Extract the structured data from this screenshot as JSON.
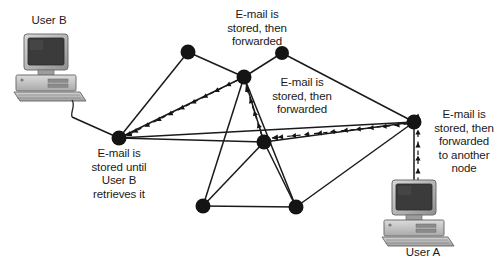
{
  "diagram": {
    "colors": {
      "node_fill": "#141414",
      "line": "#1a1a1a",
      "text": "#1a1a1a",
      "background": "#ffffff",
      "monitor_body": "#b5b5b5",
      "monitor_screen": "#3d3d3d",
      "case_body": "#bdbdbd",
      "keyboard": "#c9c9c9"
    },
    "labels": {
      "user_b": "User B",
      "user_a": "User A",
      "top_note": "E-mail is\nstored, then\nforwarded",
      "mid_note": "E-mail is\nstored, then\nforwarded",
      "left_note": "E-mail is\nstored until\nUser B\nretrieves it",
      "right_note": "E-mail is\nstored, then\nforwarded\nto another\nnode"
    },
    "nodes": [
      {
        "id": "n-top-left",
        "name": "network-node-top-left",
        "x": 188,
        "y": 52,
        "r": 7.5
      },
      {
        "id": "n-top-right",
        "name": "network-node-top-right",
        "x": 282,
        "y": 53,
        "r": 7.0
      },
      {
        "id": "n-upper-mid",
        "name": "network-node-upper-mid",
        "x": 244,
        "y": 77,
        "r": 7.5
      },
      {
        "id": "n-left",
        "name": "network-node-left",
        "x": 119,
        "y": 138,
        "r": 7.5
      },
      {
        "id": "n-center",
        "name": "network-node-center",
        "x": 264,
        "y": 142,
        "r": 7.5
      },
      {
        "id": "n-right",
        "name": "network-node-right",
        "x": 414,
        "y": 122,
        "r": 7.5
      },
      {
        "id": "n-bottom-left",
        "name": "network-node-bottom-left",
        "x": 203,
        "y": 206,
        "r": 7.5
      },
      {
        "id": "n-bottom-right",
        "name": "network-node-bottom-right",
        "x": 296,
        "y": 207,
        "r": 7.5
      }
    ],
    "links": [
      {
        "name": "link-userb-to-left",
        "from": [
          72,
          117
        ],
        "to": [
          119,
          138
        ]
      },
      {
        "name": "link-left-to-topleft",
        "from": [
          119,
          138
        ],
        "to": [
          188,
          52
        ]
      },
      {
        "name": "link-topleft-to-uppermid",
        "from": [
          188,
          52
        ],
        "to": [
          244,
          77
        ]
      },
      {
        "name": "link-topright-to-uppermid",
        "from": [
          282,
          53
        ],
        "to": [
          244,
          77
        ]
      },
      {
        "name": "link-topright-to-right",
        "from": [
          282,
          53
        ],
        "to": [
          414,
          122
        ]
      },
      {
        "name": "link-left-to-uppermid",
        "from": [
          119,
          138
        ],
        "to": [
          244,
          77
        ]
      },
      {
        "name": "link-left-to-center",
        "from": [
          119,
          138
        ],
        "to": [
          264,
          142
        ]
      },
      {
        "name": "link-left-to-right-long",
        "from": [
          119,
          138
        ],
        "to": [
          414,
          122
        ]
      },
      {
        "name": "link-uppermid-to-center",
        "from": [
          244,
          77
        ],
        "to": [
          264,
          142
        ]
      },
      {
        "name": "link-uppermid-to-bottomleft",
        "from": [
          244,
          77
        ],
        "to": [
          203,
          206
        ]
      },
      {
        "name": "link-uppermid-to-bottomright",
        "from": [
          244,
          77
        ],
        "to": [
          296,
          207
        ]
      },
      {
        "name": "link-center-to-right",
        "from": [
          264,
          142
        ],
        "to": [
          414,
          122
        ]
      },
      {
        "name": "link-center-to-bottomleft",
        "from": [
          264,
          142
        ],
        "to": [
          203,
          206
        ]
      },
      {
        "name": "link-center-to-bottomright",
        "from": [
          264,
          142
        ],
        "to": [
          296,
          207
        ]
      },
      {
        "name": "link-bottomleft-to-bottomright",
        "from": [
          203,
          206
        ],
        "to": [
          296,
          207
        ]
      },
      {
        "name": "link-bottomright-to-right",
        "from": [
          296,
          207
        ],
        "to": [
          414,
          122
        ]
      },
      {
        "name": "link-right-to-usera",
        "from": [
          414,
          122
        ],
        "to": [
          414,
          188
        ]
      }
    ],
    "flow_arrows": [
      {
        "name": "flow-right-to-center",
        "from": [
          408,
          124
        ],
        "to": [
          272,
          138
        ],
        "style": "dashed"
      },
      {
        "name": "flow-center-to-uppermid",
        "from": [
          262,
          136
        ],
        "to": [
          246,
          86
        ],
        "style": "dashed"
      },
      {
        "name": "flow-uppermid-to-left",
        "from": [
          238,
          80
        ],
        "to": [
          126,
          136
        ],
        "style": "dashed"
      },
      {
        "name": "flow-usera-to-right",
        "from": [
          418,
          182
        ],
        "to": [
          418,
          114
        ],
        "style": "dashed"
      }
    ],
    "computers": [
      {
        "name": "computer-user-b",
        "x": 14,
        "y": 30,
        "w": 72,
        "h": 72
      },
      {
        "name": "computer-user-a",
        "x": 382,
        "y": 176,
        "w": 72,
        "h": 68
      }
    ]
  }
}
